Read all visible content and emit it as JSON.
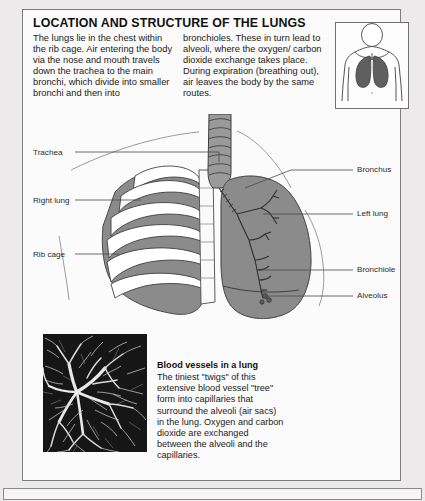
{
  "page": {
    "title": "LOCATION AND STRUCTURE OF THE LUNGS",
    "intro_left": "The lungs lie in the chest within the rib cage. Air entering the body via the nose and mouth travels down the trachea to the main bronchi, which divide into smaller bronchi and then into",
    "intro_right": "bronchioles. These in turn lead to alveoli, where the oxygen/ carbon dioxide exchange takes place. During expiration (breathing out), air leaves the body by the same routes."
  },
  "colors": {
    "page_background": "#eceaea",
    "panel_background": "#fcfbfb",
    "panel_border": "#7d7d7d",
    "lung_fill": "#8e8e8e",
    "lung_fill_dark": "#6f6f6f",
    "rib_fill": "#ffffff",
    "photo_background": "#1b1b1b",
    "vessel_color": "#f2f2f2",
    "text": "#1a1a1a"
  },
  "labels": {
    "left": [
      {
        "text": "Trachea"
      },
      {
        "text": "Right lung"
      },
      {
        "text": "Rib cage"
      }
    ],
    "right": [
      {
        "text": "Bronchus"
      },
      {
        "text": "Left lung"
      },
      {
        "text": "Bronchiole"
      },
      {
        "text": "Alveolus"
      }
    ]
  },
  "photo_caption": {
    "heading": "Blood vessels in a lung",
    "body": "The tiniest \"twigs\" of this extensive blood vessel \"tree\" form into capillaries that surround the alveoli (air sacs) in the lung. Oxygen and carbon dioxide are exchanged between the alveoli and the capillaries."
  },
  "torso_inset": {
    "icon": "human-torso-with-lungs"
  }
}
